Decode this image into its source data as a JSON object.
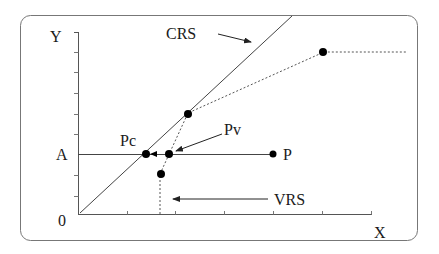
{
  "diagram": {
    "type": "efficiency-frontier",
    "axes": {
      "y_label": "Y",
      "x_label": "X",
      "origin_label": "0",
      "level_label": "A"
    },
    "labels": {
      "crs": "CRS",
      "vrs": "VRS",
      "pc": "Pc",
      "pv": "Pv",
      "p": "P"
    },
    "colors": {
      "line": "#333333",
      "border": "#666666",
      "point": "#000000",
      "background": "#ffffff"
    }
  }
}
